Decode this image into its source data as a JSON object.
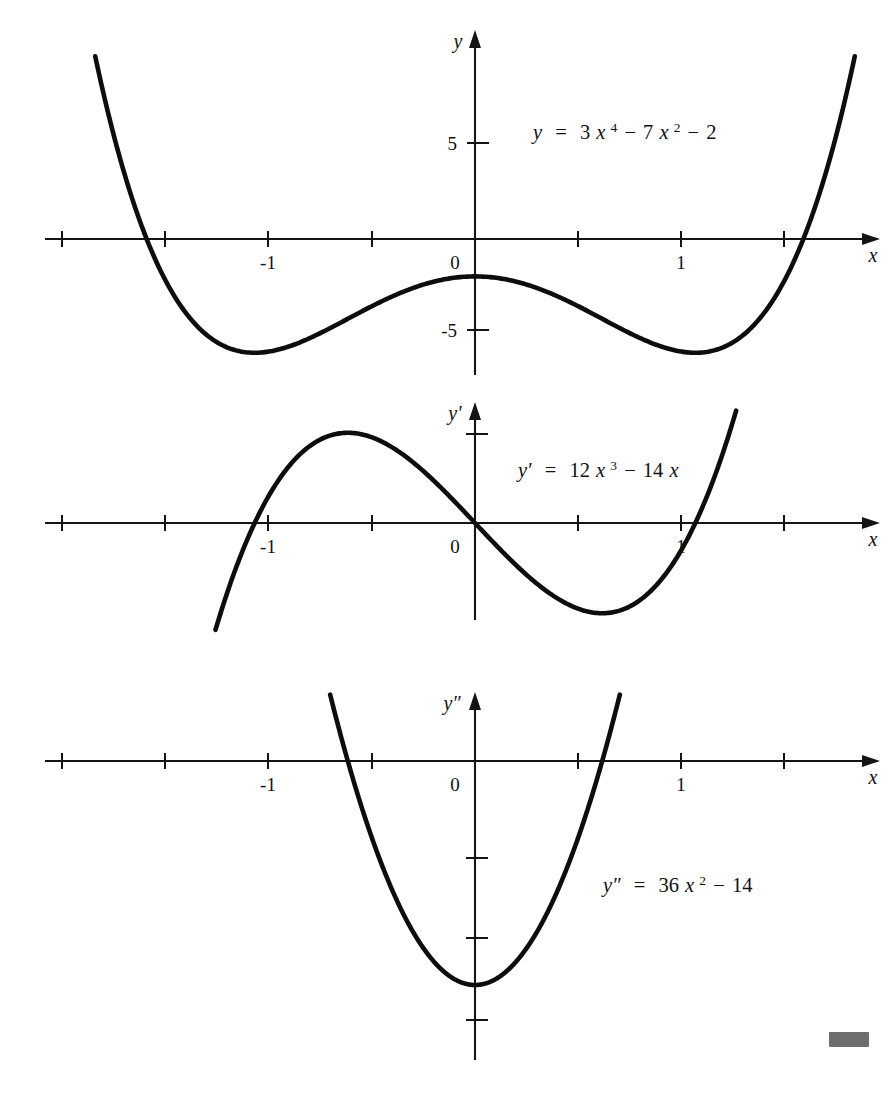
{
  "figure": {
    "kind": "math-graph-triptych",
    "background_color": "#ffffff",
    "ink_color": "#111111",
    "marker_color": "#6e6e6e"
  },
  "panels": [
    {
      "id": "panel-y",
      "axis_y_label": "y",
      "axis_x_label": "x",
      "equation_plain": "y = 3x⁴ − 7x² − 2",
      "equation_parts": {
        "lhs": "y",
        "eq": "=",
        "t1_coef": "3",
        "t1_var": "x",
        "t1_exp": "4",
        "t1_op": "−",
        "t2_coef": "7",
        "t2_var": "x",
        "t2_exp": "2",
        "t2_op": "−",
        "t3": "2"
      },
      "x_tick_labels": [
        "-1",
        "0",
        "1"
      ],
      "y_tick_labels": [
        "5",
        "-5"
      ]
    },
    {
      "id": "panel-yprime",
      "axis_y_label": "y′",
      "axis_x_label": "x",
      "equation_plain": "y′ = 12x³ − 14x",
      "equation_parts": {
        "lhs": "y′",
        "eq": "=",
        "t1_coef": "12",
        "t1_var": "x",
        "t1_exp": "3",
        "t1_op": "−",
        "t2_coef": "14",
        "t2_var": "x"
      },
      "x_tick_labels": [
        "-1",
        "0",
        "1"
      ],
      "y_tick_labels": []
    },
    {
      "id": "panel-ydoubleprime",
      "axis_y_label": "y″",
      "axis_x_label": "x",
      "equation_plain": "y″ = 36x² − 14",
      "equation_parts": {
        "lhs": "y″",
        "eq": "=",
        "t1_coef": "36",
        "t1_var": "x",
        "t1_exp": "2",
        "t1_op": "−",
        "t2_coef": "14"
      },
      "x_tick_labels": [
        "-1",
        "0",
        "1"
      ],
      "y_tick_labels": []
    }
  ],
  "chart_data": [
    {
      "type": "line",
      "title": "y = 3x^4 - 7x^2 - 2",
      "function": "3*x**4 - 7*x**2 - 2",
      "xlabel": "x",
      "ylabel": "y",
      "xlim": [
        -2.05,
        1.95
      ],
      "ylim": [
        -7.6,
        11.0
      ],
      "grid": false,
      "legend": "none",
      "x_ticks": [
        -2,
        -1.5,
        -1,
        -0.5,
        0,
        0.5,
        1,
        1.5
      ],
      "x_tick_labels": [
        "",
        "",
        "-1",
        "",
        "0",
        "",
        "1",
        ""
      ],
      "y_ticks": [
        5,
        -5
      ],
      "y_tick_labels": [
        "5",
        "-5"
      ],
      "annotations": [
        {
          "text": "y = 3x^4 - 7x^2 - 2",
          "x": 0.55,
          "y": 6.2
        }
      ],
      "key_points": [
        {
          "label": "local-min-left",
          "x": -1.08,
          "y": -6.08
        },
        {
          "label": "local-max-center",
          "x": 0.0,
          "y": -2.0
        },
        {
          "label": "local-min-right",
          "x": 1.08,
          "y": -6.08
        },
        {
          "label": "root-left",
          "x": -1.58,
          "y": 0
        },
        {
          "label": "root-right",
          "x": 1.58,
          "y": 0
        }
      ]
    },
    {
      "type": "line",
      "title": "y' = 12x^3 - 14x",
      "function": "12*x**3 - 14*x",
      "xlabel": "x",
      "ylabel": "y'",
      "xlim": [
        -2.05,
        1.95
      ],
      "ylim": [
        -8.0,
        8.0
      ],
      "grid": false,
      "legend": "none",
      "x_ticks": [
        -2,
        -1.5,
        -1,
        -0.5,
        0,
        0.5,
        1,
        1.5
      ],
      "x_tick_labels": [
        "",
        "",
        "-1",
        "",
        "0",
        "",
        "1",
        ""
      ],
      "y_ticks": [
        5
      ],
      "y_tick_labels": [
        ""
      ],
      "annotations": [
        {
          "text": "y' = 12x^3 - 14x",
          "x": 0.55,
          "y": 4.3
        }
      ],
      "key_points": [
        {
          "label": "root-left",
          "x": -1.08,
          "y": 0
        },
        {
          "label": "local-max",
          "x": -0.624,
          "y": 5.82
        },
        {
          "label": "root-origin",
          "x": 0.0,
          "y": 0
        },
        {
          "label": "local-min",
          "x": 0.624,
          "y": -5.82
        },
        {
          "label": "root-right",
          "x": 1.08,
          "y": 0
        }
      ]
    },
    {
      "type": "line",
      "title": "y'' = 36x^2 - 14",
      "function": "36*x**2 - 14",
      "xlabel": "x",
      "ylabel": "y''",
      "xlim": [
        -2.05,
        1.95
      ],
      "ylim": [
        -20.0,
        16.0
      ],
      "grid": false,
      "legend": "none",
      "x_ticks": [
        -2,
        -1.5,
        -1,
        -0.5,
        0,
        0.5,
        1,
        1.5
      ],
      "x_tick_labels": [
        "",
        "",
        "-1",
        "",
        "0",
        "",
        "1",
        ""
      ],
      "y_ticks": [
        -5,
        -10,
        -15
      ],
      "y_tick_labels": [
        "",
        "",
        ""
      ],
      "annotations": [
        {
          "text": "y'' = 36x^2 - 14",
          "x": 0.72,
          "y": -7.6
        }
      ],
      "key_points": [
        {
          "label": "vertex-min",
          "x": 0.0,
          "y": -14.0
        },
        {
          "label": "root-left",
          "x": -0.624,
          "y": 0
        },
        {
          "label": "root-right",
          "x": 0.624,
          "y": 0
        }
      ]
    }
  ]
}
